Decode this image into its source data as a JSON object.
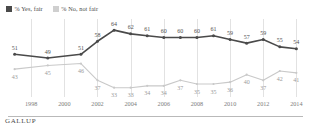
{
  "legend": {
    "items": [
      {
        "label": "% Yes, fair",
        "color": "#4a4a4a",
        "key": "yes_fair"
      },
      {
        "label": "% No, not fair",
        "color": "#cfcfcf",
        "key": "no_not_fair"
      }
    ]
  },
  "footer": {
    "brand": "GALLUP"
  },
  "chart_data": {
    "type": "line",
    "title": "",
    "xlabel": "",
    "ylabel": "",
    "grid": true,
    "legend_position": "top-left",
    "ylim": [
      28,
      70
    ],
    "xlim": [
      1996.6,
      2014.4
    ],
    "x": [
      1997,
      1999,
      2001,
      2002,
      2003,
      2004,
      2005,
      2006,
      2007,
      2008,
      2009,
      2010,
      2011,
      2012,
      2013,
      2014
    ],
    "tick_labels": [
      "1998",
      "2000",
      "2002",
      "2004",
      "2006",
      "2008",
      "2010",
      "2012",
      "2014"
    ],
    "tick_values": [
      1998,
      2000,
      2002,
      2004,
      2006,
      2008,
      2010,
      2012,
      2014
    ],
    "series": [
      {
        "name": "% Yes, fair",
        "color": "#4a4a4a",
        "values": [
          51,
          49,
          51,
          58,
          64,
          62,
          61,
          60,
          60,
          60,
          61,
          59,
          57,
          59,
          55,
          54
        ],
        "label_side": "above"
      },
      {
        "name": "% No, not fair",
        "color": "#c9c9c9",
        "values": [
          43,
          45,
          46,
          37,
          33,
          33,
          34,
          34,
          37,
          35,
          35,
          36,
          40,
          37,
          42,
          41
        ],
        "label_side": "below"
      }
    ]
  }
}
